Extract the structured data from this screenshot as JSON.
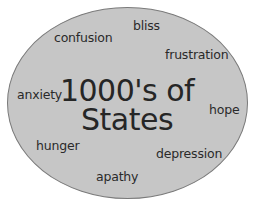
{
  "diagram": {
    "type": "ellipse-word-cloud",
    "colors": {
      "background": "#ffffff",
      "ellipse_fill": "#c6c6c6",
      "ellipse_stroke": "#7a7a7a",
      "text": "#2a2a2a"
    },
    "title": {
      "line1": "1000's of",
      "line2": "States"
    },
    "states": [
      {
        "label": "bliss"
      },
      {
        "label": "confusion"
      },
      {
        "label": "frustration"
      },
      {
        "label": "anxiety"
      },
      {
        "label": "hope"
      },
      {
        "label": "hunger"
      },
      {
        "label": "depression"
      },
      {
        "label": "apathy"
      }
    ]
  }
}
